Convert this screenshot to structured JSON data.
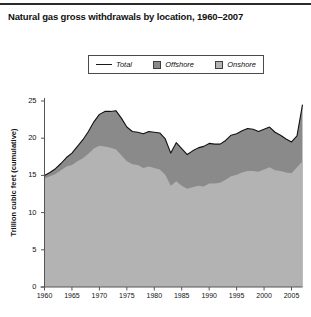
{
  "chart_title": "Natural gas gross withdrawals by location, 1960–2007",
  "legend": {
    "total": "Total",
    "offshore": "Offshore",
    "onshore": "Onshore"
  },
  "colors": {
    "offshore": "#8a8a8a",
    "onshore": "#b3b3b3",
    "total_line": "#111111",
    "axis": "#555555",
    "text": "#111111",
    "background": "#ffffff",
    "top_rule": "#2b2b2b"
  },
  "chart_data": {
    "type": "area",
    "stacked": true,
    "title": "Natural gas gross withdrawals by location, 1960–2007",
    "xlabel": "",
    "ylabel": "Trillion cubic feet (cumulative)",
    "xlim": [
      1960,
      2007
    ],
    "ylim": [
      0,
      25
    ],
    "grid": false,
    "legend_position": "top-center",
    "xticks": [
      1960,
      1965,
      1970,
      1975,
      1980,
      1985,
      1990,
      1995,
      2000,
      2005
    ],
    "yticks": [
      0,
      5,
      10,
      15,
      20,
      25
    ],
    "x": [
      1960,
      1961,
      1962,
      1963,
      1964,
      1965,
      1966,
      1967,
      1968,
      1969,
      1970,
      1971,
      1972,
      1973,
      1974,
      1975,
      1976,
      1977,
      1978,
      1979,
      1980,
      1981,
      1982,
      1983,
      1984,
      1985,
      1986,
      1987,
      1988,
      1989,
      1990,
      1991,
      1992,
      1993,
      1994,
      1995,
      1996,
      1997,
      1998,
      1999,
      2000,
      2001,
      2002,
      2003,
      2004,
      2005,
      2006,
      2007
    ],
    "series": [
      {
        "name": "Onshore",
        "values": [
          14.6,
          14.9,
          15.2,
          15.7,
          16.2,
          16.4,
          16.9,
          17.3,
          17.9,
          18.6,
          19.0,
          18.9,
          18.7,
          18.5,
          17.7,
          16.9,
          16.5,
          16.4,
          16.0,
          16.2,
          16.0,
          15.8,
          15.1,
          13.6,
          14.2,
          13.6,
          13.2,
          13.4,
          13.6,
          13.5,
          13.9,
          13.9,
          14.0,
          14.4,
          14.9,
          15.1,
          15.4,
          15.6,
          15.6,
          15.5,
          15.8,
          16.1,
          15.7,
          15.6,
          15.4,
          15.3,
          16.1,
          16.9
        ]
      },
      {
        "name": "Offshore",
        "values": [
          0.4,
          0.5,
          0.7,
          0.9,
          1.2,
          1.6,
          2.0,
          2.5,
          3.0,
          3.6,
          4.2,
          4.7,
          4.9,
          5.2,
          5.0,
          4.6,
          4.4,
          4.4,
          4.6,
          4.7,
          4.8,
          4.9,
          4.8,
          4.4,
          5.2,
          5.0,
          4.6,
          4.9,
          5.1,
          5.4,
          5.4,
          5.3,
          5.2,
          5.3,
          5.5,
          5.5,
          5.6,
          5.7,
          5.6,
          5.4,
          5.4,
          5.4,
          5.1,
          4.8,
          4.5,
          4.2,
          4.2,
          7.6
        ]
      }
    ],
    "total_values": [
      15.0,
      15.4,
      15.9,
      16.6,
      17.4,
      18.0,
      18.9,
      19.8,
      20.9,
      22.2,
      23.2,
      23.6,
      23.6,
      23.7,
      22.7,
      21.5,
      20.9,
      20.8,
      20.6,
      20.9,
      20.8,
      20.7,
      19.9,
      18.0,
      19.4,
      18.6,
      17.8,
      18.3,
      18.7,
      18.9,
      19.3,
      19.2,
      19.2,
      19.7,
      20.4,
      20.6,
      21.0,
      21.3,
      21.2,
      20.9,
      21.2,
      21.5,
      20.8,
      20.4,
      19.9,
      19.5,
      20.3,
      24.5
    ]
  }
}
